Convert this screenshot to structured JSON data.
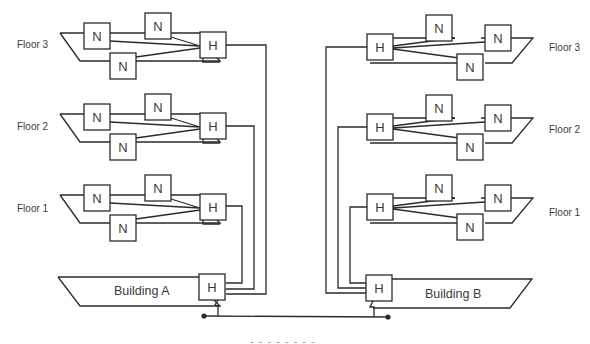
{
  "diagram": {
    "type": "network-topology",
    "stroke_color": "#2b2b2b",
    "text_color": "#3a3a3a",
    "node_label": "N",
    "hub_label": "H",
    "buildings": [
      {
        "name": "Building A",
        "floors": [
          {
            "label": "Floor 3",
            "nodes": [
              "N",
              "N",
              "N"
            ],
            "hub": "H"
          },
          {
            "label": "Floor 2",
            "nodes": [
              "N",
              "N",
              "N"
            ],
            "hub": "H"
          },
          {
            "label": "Floor 1",
            "nodes": [
              "N",
              "N",
              "N"
            ],
            "hub": "H"
          }
        ],
        "building_hub": "H"
      },
      {
        "name": "Building B",
        "floors": [
          {
            "label": "Floor 3",
            "nodes": [
              "N",
              "N",
              "N"
            ],
            "hub": "H"
          },
          {
            "label": "Floor 2",
            "nodes": [
              "N",
              "N",
              "N"
            ],
            "hub": "H"
          },
          {
            "label": "Floor 1",
            "nodes": [
              "N",
              "N",
              "N"
            ],
            "hub": "H"
          }
        ],
        "building_hub": "H"
      }
    ],
    "backbone": {
      "label": "Backbone LAN (partially cropped)"
    }
  },
  "labels": {
    "a_floor3": "Floor 3",
    "a_floor2": "Floor 2",
    "a_floor1": "Floor 1",
    "b_floor3": "Floor 3",
    "b_floor2": "Floor 2",
    "b_floor1": "Floor 1",
    "building_a": "Building A",
    "building_b": "Building B",
    "n": "N",
    "h": "H"
  }
}
